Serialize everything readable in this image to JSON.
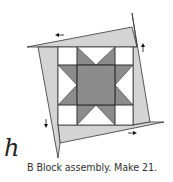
{
  "figure": {
    "step_label": "h",
    "caption": "B Block assembly. Make 21.",
    "colors": {
      "strip_fill": "#d4d4d4",
      "star_fill": "#8c8c8c",
      "background_fill": "#ffffff",
      "outline": "#333333",
      "arrow": "#111111"
    },
    "parts": [
      {
        "name": "top-strip",
        "arrow": "left"
      },
      {
        "name": "right-strip",
        "arrow": "up"
      },
      {
        "name": "bottom-strip",
        "arrow": "right"
      },
      {
        "name": "left-strip",
        "arrow": "down"
      },
      {
        "name": "star-center-square"
      },
      {
        "name": "star-points",
        "count": 8
      },
      {
        "name": "corner-squares",
        "count": 4
      }
    ]
  }
}
